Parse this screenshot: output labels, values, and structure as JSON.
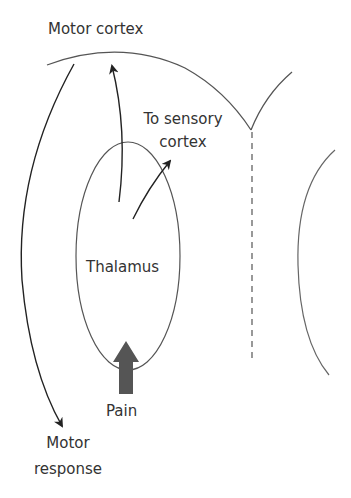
{
  "diagram": {
    "labels": {
      "motor_cortex": "Motor cortex",
      "to_sensory_line1": "To sensory",
      "to_sensory_line2": "cortex",
      "thalamus": "Thalamus",
      "pain": "Pain",
      "motor_response_line1": "Motor",
      "motor_response_line2": "response"
    },
    "colors": {
      "line": "#555555",
      "arrow": "#222222",
      "pain_arrow": "#555555",
      "text": "#333333"
    }
  }
}
